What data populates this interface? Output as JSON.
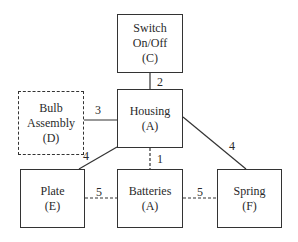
{
  "nodes": [
    {
      "id": "switch",
      "lines": [
        "Switch",
        "On/Off",
        "(C)"
      ],
      "style": "solid"
    },
    {
      "id": "housing",
      "lines": [
        "Housing",
        "(A)"
      ],
      "style": "solid"
    },
    {
      "id": "bulb",
      "lines": [
        "Bulb",
        "Assembly",
        "(D)"
      ],
      "style": "dashed"
    },
    {
      "id": "plate",
      "lines": [
        "Plate",
        "(E)"
      ],
      "style": "solid"
    },
    {
      "id": "batteries",
      "lines": [
        "Batteries",
        "(A)"
      ],
      "style": "solid"
    },
    {
      "id": "spring",
      "lines": [
        "Spring",
        "(F)"
      ],
      "style": "solid"
    }
  ],
  "edges": [
    {
      "from": "switch",
      "to": "housing",
      "label": "2",
      "style": "solid"
    },
    {
      "from": "bulb",
      "to": "housing",
      "label": "3",
      "style": "solid"
    },
    {
      "from": "housing",
      "to": "plate",
      "label": "4",
      "style": "solid"
    },
    {
      "from": "housing",
      "to": "spring",
      "label": "4",
      "style": "solid"
    },
    {
      "from": "housing",
      "to": "batteries",
      "label": "1",
      "style": "dashed"
    },
    {
      "from": "plate",
      "to": "batteries",
      "label": "5",
      "style": "dashed"
    },
    {
      "from": "batteries",
      "to": "spring",
      "label": "5",
      "style": "dashed"
    }
  ]
}
